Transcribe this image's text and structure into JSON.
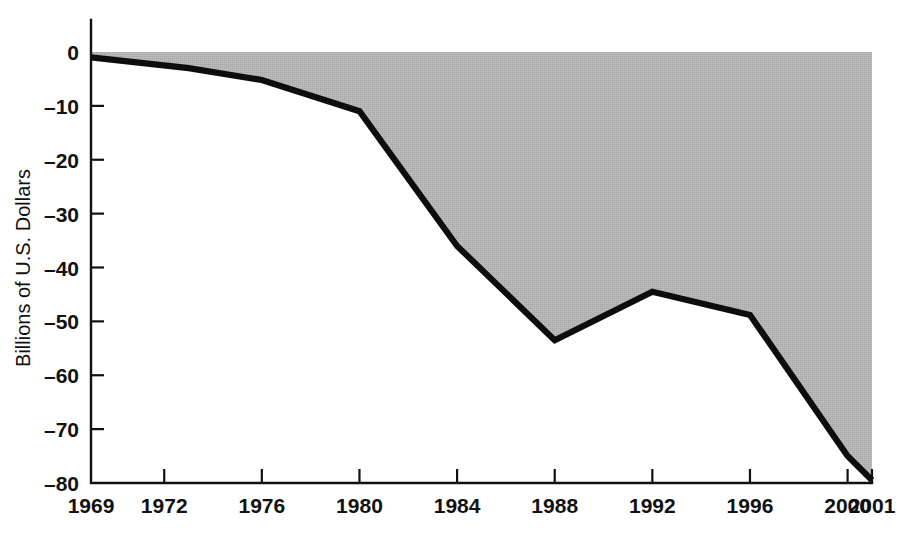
{
  "chart_data": {
    "type": "area",
    "title": "",
    "subtitle": "",
    "xlabel": "",
    "ylabel": "Billions of U.S. Dollars",
    "x": [
      1969,
      1973,
      1976,
      1980,
      1984,
      1988,
      1992,
      1996,
      2000,
      2001
    ],
    "values": [
      -1.0,
      -3.0,
      -5.2,
      -11.0,
      -36.0,
      -53.5,
      -44.5,
      -48.8,
      -75.0,
      -79.5
    ],
    "series": [
      {
        "name": "Balance",
        "values": [
          -1.0,
          -3.0,
          -5.2,
          -11.0,
          -36.0,
          -53.5,
          -44.5,
          -48.8,
          -75.0,
          -79.5
        ]
      }
    ],
    "xlim": [
      1969,
      2001
    ],
    "ylim": [
      -80,
      0
    ],
    "x_tick_values": [
      1969,
      1972,
      1976,
      1980,
      1984,
      1988,
      1992,
      1996,
      2000,
      2001
    ],
    "x_tick_labels": [
      "1969",
      "1972",
      "1976",
      "1980",
      "1984",
      "1988",
      "1992",
      "1996",
      "2000",
      "2001"
    ],
    "y_tick_values": [
      0,
      -10,
      -20,
      -30,
      -40,
      -50,
      -60,
      -70,
      -80
    ],
    "y_tick_labels": [
      "0",
      "–10",
      "–20",
      "–30",
      "–40",
      "–50",
      "–60",
      "–70",
      "–80"
    ],
    "grid": false,
    "legend": "none",
    "baseline": 0,
    "fill_color": "#b4b4b4",
    "line_color": "#0d0d0d",
    "axis_color": "#111111",
    "background_color": "#ffffff"
  }
}
